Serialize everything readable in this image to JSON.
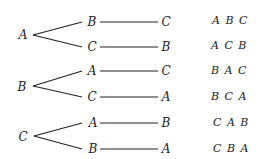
{
  "diagram": {
    "type": "permutation tree diagram",
    "roots": [
      {
        "label": "A",
        "branches": [
          {
            "first": "B",
            "second": "C",
            "result": "A B C"
          },
          {
            "first": "C",
            "second": "B",
            "result": "A C B"
          }
        ]
      },
      {
        "label": "B",
        "branches": [
          {
            "first": "A",
            "second": "C",
            "result": "B A C"
          },
          {
            "first": "C",
            "second": "A",
            "result": "B C A"
          }
        ]
      },
      {
        "label": "C",
        "branches": [
          {
            "first": "A",
            "second": "B",
            "result": "C A B"
          },
          {
            "first": "B",
            "second": "A",
            "result": "C B A"
          }
        ]
      }
    ]
  }
}
